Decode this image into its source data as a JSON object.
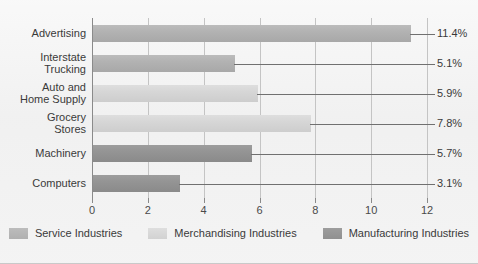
{
  "chart_data": {
    "type": "bar",
    "orientation": "horizontal",
    "title": "",
    "subtitle": "",
    "xlabel": "",
    "ylabel": "",
    "xlim": [
      0,
      12
    ],
    "xticks": [
      0,
      2,
      4,
      6,
      8,
      10,
      12
    ],
    "xticklabels": [
      "0",
      "2",
      "4",
      "6",
      "8",
      "10",
      "12"
    ],
    "grid": "vertical",
    "legend_position": "bottom",
    "categories": [
      "Advertising",
      "Interstate Trucking",
      "Auto and Home Supply",
      "Grocery Stores",
      "Machinery",
      "Computers"
    ],
    "category_label_lines": [
      [
        "Advertising"
      ],
      [
        "Interstate",
        "Trucking"
      ],
      [
        "Auto and",
        "Home Supply"
      ],
      [
        "Grocery",
        "Stores"
      ],
      [
        "Machinery"
      ],
      [
        "Computers"
      ]
    ],
    "values": [
      11.4,
      5.1,
      5.9,
      7.8,
      5.7,
      3.1
    ],
    "value_labels": [
      "11.4%",
      "5.1%",
      "5.9%",
      "7.8%",
      "5.7%",
      "3.1%"
    ],
    "bar_series": [
      "service",
      "service",
      "merchandising",
      "merchandising",
      "manufacturing",
      "manufacturing"
    ],
    "series": [
      {
        "name": "Service Industries",
        "key": "service",
        "color": "#b2b2b2"
      },
      {
        "name": "Merchandising Industries",
        "key": "merchandising",
        "color": "#d6d6d6"
      },
      {
        "name": "Manufacturing Industries",
        "key": "manufacturing",
        "color": "#949494"
      }
    ]
  },
  "legend": {
    "items": [
      {
        "label": "Service Industries",
        "key": "service"
      },
      {
        "label": "Merchandising Industries",
        "key": "merchandising"
      },
      {
        "label": "Manufacturing Industries",
        "key": "manufacturing"
      }
    ]
  },
  "colors": {
    "background": "#f1f1f1",
    "axis": "#8a8a8a",
    "gridline": "#c4c4c4",
    "leader_line": "#707070",
    "text": "#3a3a3a",
    "series_service": "#b2b2b2",
    "series_merchandising": "#d6d6d6",
    "series_manufacturing": "#949494"
  }
}
